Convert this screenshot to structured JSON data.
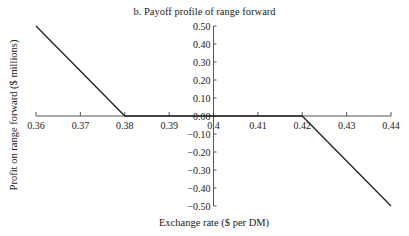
{
  "chart_data": {
    "type": "line",
    "title": "b. Payoff profile of range forward",
    "xlabel": "Exchange rate ($ per DM)",
    "ylabel": "Profit on range forward ($ millions)",
    "xlim": [
      0.36,
      0.44
    ],
    "ylim": [
      -0.5,
      0.5
    ],
    "x_ticks": [
      "0.36",
      "0.37",
      "0.38",
      "0.39",
      "0.4",
      "0.41",
      "0.42",
      "0.43",
      "0.44"
    ],
    "y_ticks": [
      "0.50",
      "0.40",
      "0.30",
      "0.20",
      "0.10",
      "0.00",
      "-0.10",
      "-0.20",
      "-0.30",
      "-0.40",
      "-0.50"
    ],
    "grid": false,
    "legend": null,
    "series": [
      {
        "name": "Payoff",
        "x": [
          0.36,
          0.38,
          0.42,
          0.44
        ],
        "y": [
          0.5,
          0.0,
          0.0,
          -0.5
        ]
      }
    ]
  }
}
